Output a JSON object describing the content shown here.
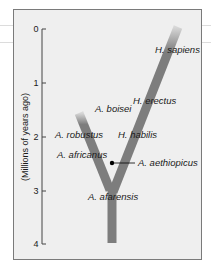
{
  "diagram": {
    "axis": {
      "title": "(Millions of years ago)",
      "ticks": [
        "0",
        "1",
        "2",
        "3",
        "4"
      ],
      "range": [
        0,
        4
      ]
    },
    "species": [
      {
        "name": "H. sapiens"
      },
      {
        "name": "H. erectus"
      },
      {
        "name": "A. boisei"
      },
      {
        "name": "A. robustus"
      },
      {
        "name": "H. habilis"
      },
      {
        "name": "A. africanus"
      },
      {
        "name": "A. aethiopicus"
      },
      {
        "name": "A. afarensis"
      }
    ],
    "colors": {
      "background": "#efefef",
      "branch": "#7d7d7d",
      "frame": "#7a7a7a",
      "text": "#1a1a1a"
    }
  }
}
